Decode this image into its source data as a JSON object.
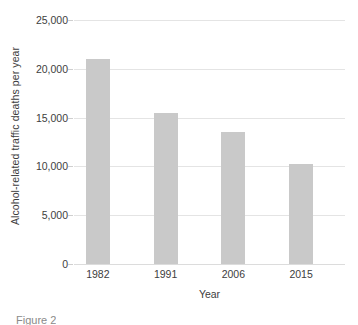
{
  "chart_data": {
    "type": "bar",
    "title": "",
    "xlabel": "Year",
    "ylabel": "Alcohol-related traffic deaths per year",
    "categories": [
      "1982",
      "1991",
      "2006",
      "2015"
    ],
    "values": [
      21000,
      15500,
      13500,
      10200
    ],
    "ylim": [
      0,
      25000
    ],
    "yticks": [
      0,
      5000,
      10000,
      15000,
      20000,
      25000
    ],
    "ytick_labels": [
      "0",
      "5,000",
      "10,000",
      "15,000",
      "20,000",
      "25,000"
    ],
    "grid": true,
    "legend": null,
    "bar_color": "#c9c9c9",
    "gridline_color": "#e4e4e4",
    "text_color": "#3d3d3d",
    "background": "#ffffff"
  },
  "caption": {
    "text": "Figure 2"
  }
}
